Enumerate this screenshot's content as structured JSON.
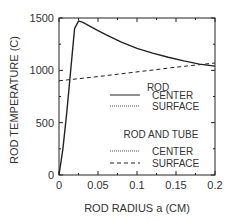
{
  "chart_data": {
    "type": "line",
    "title": "",
    "xlabel": "ROD RADIUS  a (CM)",
    "ylabel": "ROD TEMPERATURE (C)",
    "xlim": [
      0,
      0.2
    ],
    "ylim": [
      0,
      1500
    ],
    "xticks": [
      0,
      0.05,
      0.1,
      0.15,
      0.2
    ],
    "xtick_labels": [
      "0",
      "0.05",
      "0.1",
      "0.15",
      "0.2"
    ],
    "yticks": [
      0,
      500,
      1000,
      1500
    ],
    "ytick_labels": [
      "0",
      "500",
      "1000",
      "1500"
    ],
    "grid": false,
    "legend_position": "lower right inside",
    "legend_groups": [
      {
        "title": "ROD",
        "entries": [
          {
            "label": "CENTER",
            "style": "solid"
          },
          {
            "label": "SURFACE",
            "style": "dotted"
          }
        ]
      },
      {
        "title": "ROD AND TUBE",
        "entries": [
          {
            "label": "CENTER",
            "style": "dotted"
          },
          {
            "label": "SURFACE",
            "style": "dashed"
          }
        ]
      }
    ],
    "series": [
      {
        "name": "ROD CENTER",
        "style": "solid",
        "x": [
          0,
          0.005,
          0.01,
          0.015,
          0.02,
          0.025,
          0.03,
          0.04,
          0.05,
          0.06,
          0.08,
          0.1,
          0.12,
          0.14,
          0.16,
          0.18,
          0.2
        ],
        "y": [
          0,
          250,
          600,
          1000,
          1400,
          1470,
          1460,
          1420,
          1380,
          1340,
          1270,
          1210,
          1165,
          1125,
          1090,
          1060,
          1040
        ]
      },
      {
        "name": "ROD AND TUBE SURFACE",
        "style": "dashed",
        "x": [
          0,
          0.05,
          0.1,
          0.15,
          0.2
        ],
        "y": [
          900,
          940,
          985,
          1030,
          1070
        ]
      }
    ]
  }
}
